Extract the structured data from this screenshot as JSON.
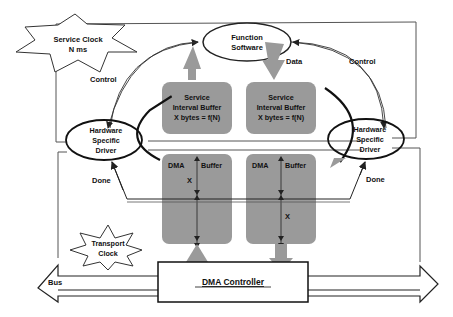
{
  "diagram": {
    "colors": {
      "buffer_fill": "#9a9a9a",
      "arrow_fill": "#9a9a9a",
      "line": "#222222",
      "background": "#ffffff"
    },
    "service_clock": {
      "line1": "Service Clock",
      "line2": "N  ms"
    },
    "transport_clock": {
      "line1": "Transport",
      "line2": "Clock"
    },
    "function_software": {
      "line1": "Function",
      "line2": "Software"
    },
    "left_driver": {
      "line1": "Hardware",
      "line2": "Specific",
      "line3": "Driver"
    },
    "right_driver": {
      "line1": "Hardware",
      "line2": "Specific",
      "line3": "Driver"
    },
    "left_sib": {
      "line1": "Service",
      "line2": "Interval Buffer",
      "line3": "X bytes = f(N)"
    },
    "right_sib": {
      "line1": "Service",
      "line2": "Interval Buffer",
      "line3": "X bytes = f(N)"
    },
    "left_dma": {
      "dma": "DMA",
      "buffer": "Buffer",
      "x": "X"
    },
    "right_dma": {
      "dma": "DMA",
      "buffer": "Buffer",
      "x": "X"
    },
    "dma_controller": "DMA Controller",
    "bus": "Bus",
    "labels": {
      "control_left": "Control",
      "control_right": "Control",
      "data": "Data",
      "done_left": "Done",
      "done_right": "Done"
    }
  }
}
